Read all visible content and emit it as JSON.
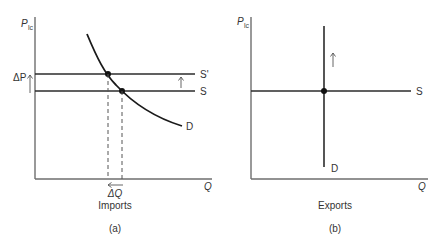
{
  "panel_a": {
    "y_axis_label": "P",
    "y_axis_subscript": "lc",
    "x_axis_label": "Q",
    "supply_original_label": "S",
    "supply_shifted_label": "S'",
    "demand_label": "D",
    "delta_p_label": "ΔP",
    "delta_q_label": "ΔQ",
    "caption": "Imports",
    "panel_tag": "(a)"
  },
  "panel_b": {
    "y_axis_label": "P",
    "y_axis_subscript": "lc",
    "x_axis_label": "Q",
    "supply_label": "S",
    "demand_label": "D",
    "caption": "Exports",
    "panel_tag": "(b)"
  },
  "colors": {
    "axis": "#6e6e6e",
    "line": "#2b2b2b",
    "text": "#333333"
  }
}
